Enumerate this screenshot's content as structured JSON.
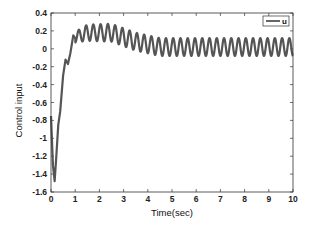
{
  "chart_data": {
    "type": "line",
    "title": "",
    "xlabel": "Time(sec)",
    "ylabel": "Control input",
    "xlim": [
      0,
      10
    ],
    "ylim": [
      -1.6,
      0.4
    ],
    "xticks": [
      0,
      1,
      2,
      3,
      4,
      5,
      6,
      7,
      8,
      9,
      10
    ],
    "yticks": [
      0.4,
      0.2,
      0,
      -0.2,
      -0.4,
      -0.6,
      -0.8,
      -1,
      -1.2,
      -1.4,
      -1.6
    ],
    "ytick_labels": [
      "0.4",
      "0.2",
      "0",
      "-0.2",
      "-0.4",
      "-0.6",
      "-0.8",
      "-1",
      "-1.2",
      "-1.4",
      "-1.6"
    ],
    "grid": false,
    "legend": {
      "position": "upper right",
      "entries": [
        "u"
      ]
    },
    "series": [
      {
        "name": "u",
        "color": "#555555",
        "transient_points": [
          [
            0.0,
            -0.75
          ],
          [
            0.08,
            -1.3
          ],
          [
            0.15,
            -1.48
          ],
          [
            0.22,
            -1.2
          ],
          [
            0.3,
            -0.85
          ],
          [
            0.38,
            -0.7
          ],
          [
            0.5,
            -0.3
          ],
          [
            0.6,
            -0.12
          ],
          [
            0.7,
            -0.17
          ],
          [
            0.8,
            -0.05
          ],
          [
            0.92,
            0.15
          ],
          [
            1.0,
            0.12
          ]
        ],
        "oscillation": {
          "start_time": 1.0,
          "period_sec": 0.3,
          "envelope": [
            {
              "t": 1.0,
              "center": 0.13,
              "amplitude": 0.06
            },
            {
              "t": 1.5,
              "center": 0.18,
              "amplitude": 0.09
            },
            {
              "t": 2.5,
              "center": 0.18,
              "amplitude": 0.1
            },
            {
              "t": 3.5,
              "center": 0.08,
              "amplitude": 0.1
            },
            {
              "t": 4.5,
              "center": 0.02,
              "amplitude": 0.1
            },
            {
              "t": 10.0,
              "center": 0.02,
              "amplitude": 0.1
            }
          ]
        }
      }
    ]
  }
}
